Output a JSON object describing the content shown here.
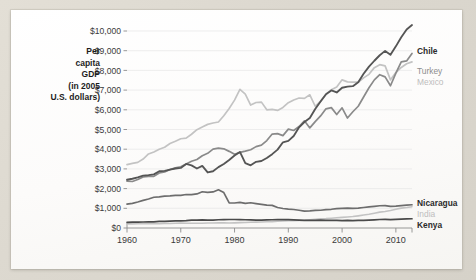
{
  "figure": {
    "axis_title_lines": [
      "Per",
      "capita",
      "GDP",
      "(in 2005",
      "U.S. dollars)"
    ],
    "background_color": "#fdfdfc",
    "page_background_color": "#dcd8cf"
  },
  "chart_data": {
    "type": "line",
    "title": "",
    "subtitle": "",
    "xlabel": "",
    "ylabel": "Per capita GDP (in 2005 U.S. dollars)",
    "xlim": [
      1960,
      2013
    ],
    "ylim": [
      0,
      10000
    ],
    "grid": true,
    "legend_position": "right-inline-labels",
    "x_tick_labels": [
      "1960",
      "1970",
      "1980",
      "1990",
      "2000",
      "2010"
    ],
    "x_ticks": [
      1960,
      1970,
      1980,
      1990,
      2000,
      2010
    ],
    "y_tick_labels": [
      "$0",
      "$1,000",
      "$2,000",
      "$3,000",
      "$4,000",
      "$5,000",
      "$6,000",
      "$7,000",
      "$8,000",
      "$9,000",
      "$10,000"
    ],
    "y_ticks": [
      0,
      1000,
      2000,
      3000,
      4000,
      5000,
      6000,
      7000,
      8000,
      9000,
      10000
    ],
    "x": [
      1960,
      1961,
      1962,
      1963,
      1964,
      1965,
      1966,
      1967,
      1968,
      1969,
      1970,
      1971,
      1972,
      1973,
      1974,
      1975,
      1976,
      1977,
      1978,
      1979,
      1980,
      1981,
      1982,
      1983,
      1984,
      1985,
      1986,
      1987,
      1988,
      1989,
      1990,
      1991,
      1992,
      1993,
      1994,
      1995,
      1996,
      1997,
      1998,
      1999,
      2000,
      2001,
      2002,
      2003,
      2004,
      2005,
      2006,
      2007,
      2008,
      2009,
      2010,
      2011,
      2012,
      2013
    ],
    "series": [
      {
        "name": "Chile",
        "color": "#555555",
        "label_style": "dark",
        "values": [
          2450,
          2500,
          2570,
          2660,
          2680,
          2720,
          2880,
          2900,
          2960,
          3020,
          3050,
          3250,
          3180,
          3020,
          3150,
          2820,
          2880,
          3090,
          3250,
          3450,
          3680,
          3860,
          3290,
          3180,
          3360,
          3400,
          3550,
          3750,
          3980,
          4350,
          4420,
          4670,
          5110,
          5380,
          5580,
          6040,
          6420,
          6790,
          6980,
          6880,
          7120,
          7180,
          7200,
          7400,
          7830,
          8190,
          8490,
          8770,
          8990,
          8790,
          9220,
          9680,
          10080,
          10300
        ]
      },
      {
        "name": "Turkey",
        "color": "#8a8a8a",
        "label_style": "mid",
        "values": [
          2380,
          2360,
          2460,
          2590,
          2620,
          2620,
          2790,
          2850,
          2970,
          3050,
          3110,
          3250,
          3390,
          3480,
          3670,
          3790,
          4000,
          4050,
          4020,
          3890,
          3740,
          3840,
          3900,
          3970,
          4130,
          4210,
          4440,
          4770,
          4790,
          4690,
          5020,
          4950,
          5150,
          5440,
          5080,
          5400,
          5690,
          6050,
          6110,
          5760,
          6100,
          5580,
          5900,
          6180,
          6650,
          7120,
          7520,
          7780,
          7670,
          7220,
          7860,
          8430,
          8480,
          8860
        ]
      },
      {
        "name": "Mexico",
        "color": "#c3c3c3",
        "label_style": "light",
        "values": [
          3220,
          3280,
          3330,
          3500,
          3760,
          3860,
          4000,
          4100,
          4290,
          4400,
          4530,
          4560,
          4760,
          4990,
          5130,
          5260,
          5330,
          5380,
          5700,
          6070,
          6490,
          7040,
          6800,
          6240,
          6370,
          6390,
          6000,
          6020,
          5970,
          6120,
          6360,
          6500,
          6600,
          6580,
          6760,
          6180,
          6440,
          6780,
          7020,
          7160,
          7520,
          7420,
          7400,
          7400,
          7620,
          7800,
          8140,
          8290,
          8230,
          7520,
          7890,
          8150,
          8340,
          8430
        ]
      },
      {
        "name": "Nicaragua",
        "color": "#6d6d6d",
        "label_style": "dark",
        "values": [
          1210,
          1250,
          1320,
          1400,
          1470,
          1560,
          1580,
          1620,
          1630,
          1660,
          1660,
          1700,
          1690,
          1730,
          1840,
          1810,
          1830,
          1940,
          1800,
          1280,
          1270,
          1300,
          1250,
          1280,
          1240,
          1200,
          1160,
          1150,
          1040,
          990,
          960,
          940,
          900,
          860,
          870,
          890,
          900,
          930,
          950,
          980,
          1000,
          1010,
          1000,
          1010,
          1040,
          1070,
          1100,
          1130,
          1140,
          1100,
          1110,
          1140,
          1160,
          1180
        ]
      },
      {
        "name": "India",
        "color": "#c3c3c3",
        "label_style": "light",
        "values": [
          210,
          210,
          212,
          220,
          232,
          218,
          214,
          226,
          228,
          238,
          248,
          244,
          238,
          243,
          240,
          253,
          250,
          262,
          270,
          250,
          262,
          272,
          276,
          292,
          298,
          306,
          316,
          322,
          344,
          358,
          374,
          368,
          382,
          394,
          412,
          436,
          462,
          474,
          496,
          522,
          540,
          560,
          580,
          616,
          656,
          700,
          752,
          806,
          834,
          886,
          956,
          1010,
          1040,
          1080
        ]
      },
      {
        "name": "Kenya",
        "color": "#4a4a4a",
        "label_style": "dark",
        "values": [
          290,
          295,
          296,
          305,
          318,
          310,
          332,
          336,
          348,
          360,
          366,
          376,
          398,
          404,
          410,
          404,
          404,
          420,
          430,
          432,
          432,
          428,
          420,
          410,
          400,
          404,
          414,
          420,
          424,
          424,
          428,
          416,
          400,
          386,
          384,
          390,
          396,
          388,
          388,
          386,
          378,
          382,
          378,
          382,
          392,
          402,
          416,
          432,
          434,
          430,
          442,
          452,
          460,
          470
        ]
      }
    ],
    "annotations": [
      {
        "text": "Chile",
        "series": "Chile",
        "position": "right-end",
        "style": "dark"
      },
      {
        "text": "Turkey",
        "series": "Turkey",
        "position": "right-end",
        "style": "mid"
      },
      {
        "text": "Mexico",
        "series": "Mexico",
        "position": "right-end",
        "style": "light"
      },
      {
        "text": "Nicaragua",
        "series": "Nicaragua",
        "position": "right-end",
        "style": "dark"
      },
      {
        "text": "India",
        "series": "India",
        "position": "right-end",
        "style": "light"
      },
      {
        "text": "Kenya",
        "series": "Kenya",
        "position": "right-end",
        "style": "dark"
      }
    ]
  }
}
